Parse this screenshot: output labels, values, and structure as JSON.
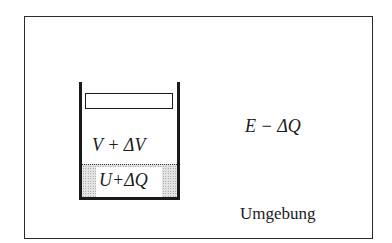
{
  "diagram": {
    "type": "thermodynamic-system-sketch",
    "system": {
      "gas_label": "V + ΔV",
      "substance_label": "U+ΔQ"
    },
    "surroundings": {
      "energy_label": "E − ΔQ",
      "name": "Umgebung"
    },
    "colors": {
      "line": "#1a1a1a",
      "background": "#ffffff",
      "shading": "#c8c8c8"
    }
  }
}
